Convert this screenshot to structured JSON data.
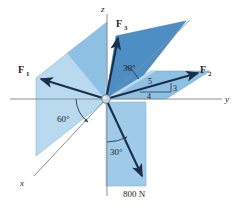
{
  "figure": {
    "background_color": "#ffffff",
    "colors": {
      "plane_light": "#b9d9ef",
      "plane_mid": "#8dc0e2",
      "plane_dark": "#4d8fc4",
      "plane_edge": "#7aa9cc",
      "vector_stroke": "#1b2f4b",
      "axis_stroke": "#8a8f94",
      "text": "#231f20",
      "origin_ball": "#c9d4dc"
    },
    "axes": [
      {
        "name": "z-axis",
        "label": "z",
        "direction": "up"
      },
      {
        "name": "y-axis",
        "label": "y",
        "direction": "right"
      },
      {
        "name": "x-axis",
        "label": "x",
        "direction": "lower-left"
      }
    ],
    "forces": [
      {
        "name": "F1",
        "label": "F",
        "subscript": "1",
        "direction": "upper-left"
      },
      {
        "name": "F2",
        "label": "F",
        "subscript": "2",
        "direction": "upper-right"
      },
      {
        "name": "F3",
        "label": "F",
        "subscript": "3",
        "direction": "upper"
      },
      {
        "name": "F800",
        "label": "800 N",
        "direction": "lower-right"
      }
    ],
    "angles": [
      {
        "name": "angle-f3-from-horizontal",
        "value": "30°"
      },
      {
        "name": "angle-plane-from-y-axis",
        "value": "60°"
      },
      {
        "name": "angle-800n-from-z-axis",
        "value": "30°"
      }
    ],
    "slope_triangle": {
      "name": "f2-slope-triangle",
      "hypotenuse": "5",
      "vertical": "3",
      "horizontal": "4"
    },
    "magnitude_label": "800 N"
  }
}
